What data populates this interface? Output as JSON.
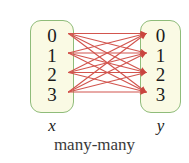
{
  "figure": {
    "caption": "many-many",
    "background_color": "#ffffff"
  },
  "domain_set": {
    "name": "x",
    "label": "x",
    "box_fill": "#FAFAE4",
    "box_border": "#8FBC7A",
    "elements": [
      {
        "label": "0"
      },
      {
        "label": "1"
      },
      {
        "label": "2"
      },
      {
        "label": "3"
      }
    ]
  },
  "codomain_set": {
    "name": "y",
    "label": "y",
    "box_fill": "#FAFAE4",
    "box_border": "#8FBC7A",
    "elements": [
      {
        "label": "0"
      },
      {
        "label": "1"
      },
      {
        "label": "2"
      },
      {
        "label": "3"
      }
    ]
  },
  "mapping": {
    "type": "many-many",
    "arrow_color": "#D2554E",
    "arrowhead_color": "#C9453F",
    "edges": [
      {
        "from": "0",
        "to": "0"
      },
      {
        "from": "0",
        "to": "1"
      },
      {
        "from": "0",
        "to": "2"
      },
      {
        "from": "0",
        "to": "3"
      },
      {
        "from": "1",
        "to": "0"
      },
      {
        "from": "1",
        "to": "1"
      },
      {
        "from": "1",
        "to": "2"
      },
      {
        "from": "1",
        "to": "3"
      },
      {
        "from": "2",
        "to": "0"
      },
      {
        "from": "2",
        "to": "1"
      },
      {
        "from": "2",
        "to": "2"
      },
      {
        "from": "2",
        "to": "3"
      },
      {
        "from": "3",
        "to": "0"
      },
      {
        "from": "3",
        "to": "1"
      },
      {
        "from": "3",
        "to": "2"
      },
      {
        "from": "3",
        "to": "3"
      }
    ]
  }
}
